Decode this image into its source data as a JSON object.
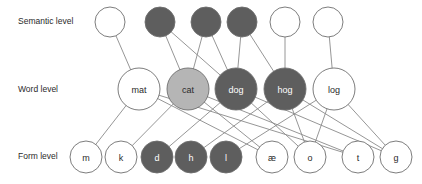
{
  "diagram": {
    "canvas": {
      "width": 422,
      "height": 184
    },
    "colors": {
      "background": "#ffffff",
      "node_fill_inactive": "#ffffff",
      "node_fill_active_dark": "#5e5e5e",
      "node_fill_active_light": "#b5b5b5",
      "node_stroke": "#6e6e6e",
      "edge": "#8a8a8a",
      "label_text": "#2a2a2a",
      "node_text_dark": "#2a2a2a",
      "node_text_light": "#ffffff"
    },
    "level_labels": [
      {
        "id": "semantic-level-label",
        "text": "Semantic level",
        "x": 18,
        "y": 22
      },
      {
        "id": "word-level-label",
        "text": "Word level",
        "x": 18,
        "y": 90
      },
      {
        "id": "form-level-label",
        "text": "Form level",
        "x": 18,
        "y": 157
      }
    ],
    "levels": [
      {
        "id": "semantic",
        "label": "Semantic level",
        "nodes": [
          {
            "id": "sem1",
            "label": "",
            "cx": 110,
            "cy": 22,
            "r": 15,
            "state": "inactive"
          },
          {
            "id": "sem2",
            "label": "",
            "cx": 160,
            "cy": 22,
            "r": 15,
            "state": "active-dark"
          },
          {
            "id": "sem3",
            "label": "",
            "cx": 206,
            "cy": 22,
            "r": 15,
            "state": "active-dark"
          },
          {
            "id": "sem4",
            "label": "",
            "cx": 242,
            "cy": 22,
            "r": 15,
            "state": "active-dark"
          },
          {
            "id": "sem5",
            "label": "",
            "cx": 285,
            "cy": 22,
            "r": 15,
            "state": "inactive"
          },
          {
            "id": "sem6",
            "label": "",
            "cx": 328,
            "cy": 22,
            "r": 15,
            "state": "inactive"
          }
        ]
      },
      {
        "id": "word",
        "label": "Word level",
        "nodes": [
          {
            "id": "mat",
            "label": "mat",
            "cx": 139,
            "cy": 89,
            "r": 21,
            "state": "inactive"
          },
          {
            "id": "cat",
            "label": "cat",
            "cx": 188,
            "cy": 89,
            "r": 21,
            "state": "active-light"
          },
          {
            "id": "dog",
            "label": "dog",
            "cx": 236,
            "cy": 89,
            "r": 21,
            "state": "active-dark"
          },
          {
            "id": "hog",
            "label": "hog",
            "cx": 285,
            "cy": 89,
            "r": 21,
            "state": "active-dark"
          },
          {
            "id": "log",
            "label": "log",
            "cx": 334,
            "cy": 89,
            "r": 21,
            "state": "inactive"
          }
        ]
      },
      {
        "id": "form",
        "label": "Form level",
        "nodes": [
          {
            "id": "m",
            "label": "m",
            "cx": 86,
            "cy": 157,
            "r": 16,
            "state": "inactive"
          },
          {
            "id": "k",
            "label": "k",
            "cx": 121,
            "cy": 157,
            "r": 16,
            "state": "inactive"
          },
          {
            "id": "d",
            "label": "d",
            "cx": 157,
            "cy": 157,
            "r": 16,
            "state": "active-dark"
          },
          {
            "id": "h",
            "label": "h",
            "cx": 191,
            "cy": 157,
            "r": 16,
            "state": "active-dark"
          },
          {
            "id": "l",
            "label": "l",
            "cx": 226,
            "cy": 157,
            "r": 16,
            "state": "active-dark"
          },
          {
            "id": "ae",
            "label": "æ",
            "cx": 272,
            "cy": 157,
            "r": 16,
            "state": "inactive"
          },
          {
            "id": "o",
            "label": "o",
            "cx": 310,
            "cy": 157,
            "r": 16,
            "state": "inactive"
          },
          {
            "id": "t",
            "label": "t",
            "cx": 358,
            "cy": 157,
            "r": 16,
            "state": "inactive"
          },
          {
            "id": "g",
            "label": "g",
            "cx": 396,
            "cy": 157,
            "r": 16,
            "state": "inactive"
          }
        ]
      }
    ],
    "edges": [
      {
        "from": "sem1",
        "to": "mat"
      },
      {
        "from": "sem2",
        "to": "cat"
      },
      {
        "from": "sem2",
        "to": "dog"
      },
      {
        "from": "sem3",
        "to": "cat"
      },
      {
        "from": "sem3",
        "to": "dog"
      },
      {
        "from": "sem4",
        "to": "dog"
      },
      {
        "from": "sem4",
        "to": "hog"
      },
      {
        "from": "sem5",
        "to": "hog"
      },
      {
        "from": "sem6",
        "to": "log"
      },
      {
        "from": "mat",
        "to": "m"
      },
      {
        "from": "mat",
        "to": "ae"
      },
      {
        "from": "mat",
        "to": "t"
      },
      {
        "from": "cat",
        "to": "k"
      },
      {
        "from": "cat",
        "to": "ae"
      },
      {
        "from": "cat",
        "to": "t"
      },
      {
        "from": "dog",
        "to": "d"
      },
      {
        "from": "dog",
        "to": "o"
      },
      {
        "from": "dog",
        "to": "g"
      },
      {
        "from": "hog",
        "to": "h"
      },
      {
        "from": "hog",
        "to": "o"
      },
      {
        "from": "hog",
        "to": "g"
      },
      {
        "from": "log",
        "to": "l"
      },
      {
        "from": "log",
        "to": "o"
      },
      {
        "from": "log",
        "to": "g"
      }
    ]
  }
}
